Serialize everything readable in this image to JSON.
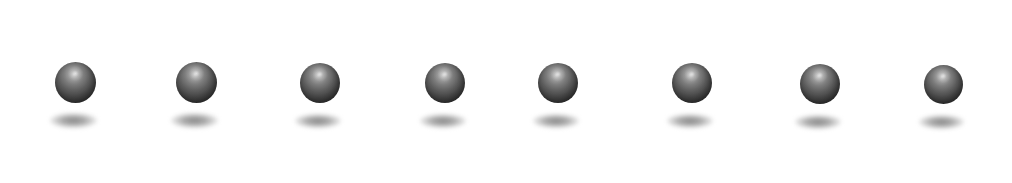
{
  "scene": {
    "title": "Row of shaded spheres with drop shadows",
    "width": 1012,
    "height": 183,
    "background_color": "#ffffff",
    "object_count": 8,
    "object_label": "sphere",
    "sphere_style": {
      "base_color": "#4a4a4a",
      "edge_color": "#343434",
      "highlight_color": "#c8c8c8",
      "highlight_position": "upper-center",
      "diameter": 41
    },
    "shadow_style": {
      "color": "#8f8f8f",
      "width": 47,
      "height": 15,
      "shape": "ellipse"
    },
    "objects": [
      {
        "index": 1,
        "cx": 75,
        "cy": 82,
        "d": 41,
        "shadow_cx": 73,
        "shadow_cy": 120,
        "sw": 47,
        "sh": 15
      },
      {
        "index": 2,
        "cx": 196,
        "cy": 82,
        "d": 41,
        "shadow_cx": 194,
        "shadow_cy": 120,
        "sw": 47,
        "sh": 15
      },
      {
        "index": 3,
        "cx": 320,
        "cy": 83,
        "d": 40,
        "shadow_cx": 318,
        "shadow_cy": 121,
        "sw": 46,
        "sh": 14
      },
      {
        "index": 4,
        "cx": 445,
        "cy": 83,
        "d": 40,
        "shadow_cx": 443,
        "shadow_cy": 121,
        "sw": 46,
        "sh": 14
      },
      {
        "index": 5,
        "cx": 558,
        "cy": 83,
        "d": 40,
        "shadow_cx": 556,
        "shadow_cy": 121,
        "sw": 46,
        "sh": 14
      },
      {
        "index": 6,
        "cx": 692,
        "cy": 83,
        "d": 40,
        "shadow_cx": 690,
        "shadow_cy": 121,
        "sw": 46,
        "sh": 14
      },
      {
        "index": 7,
        "cx": 820,
        "cy": 84,
        "d": 40,
        "shadow_cx": 818,
        "shadow_cy": 122,
        "sw": 46,
        "sh": 14
      },
      {
        "index": 8,
        "cx": 943,
        "cy": 84,
        "d": 39,
        "shadow_cx": 941,
        "shadow_cy": 122,
        "sw": 45,
        "sh": 14
      }
    ]
  }
}
